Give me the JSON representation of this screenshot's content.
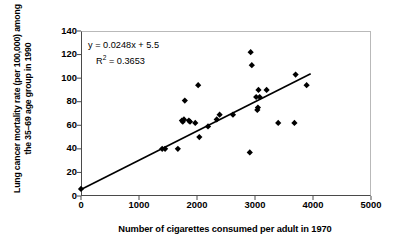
{
  "chart_data": {
    "type": "scatter",
    "title": "",
    "xlabel": "Number of cigarettes consumed per adult in 1970",
    "ylabel": "Lung cancer mortality rate (per 100,000) among the 35–69 age group in 1990",
    "xlim": [
      0,
      5000
    ],
    "ylim": [
      0,
      140
    ],
    "xticks": [
      0,
      1000,
      2000,
      3000,
      4000,
      5000
    ],
    "yticks": [
      0,
      20,
      40,
      60,
      80,
      100,
      120,
      140
    ],
    "xtick_labels": [
      "0",
      "1000",
      "2000",
      "3000",
      "4000",
      "5000"
    ],
    "ytick_labels": [
      "0",
      "20",
      "40",
      "60",
      "80",
      "100",
      "120",
      "140"
    ],
    "grid": false,
    "legend": null,
    "marker": "diamond",
    "marker_color": "#000000",
    "points": [
      {
        "x": 0,
        "y": 6
      },
      {
        "x": 1400,
        "y": 40
      },
      {
        "x": 1450,
        "y": 40
      },
      {
        "x": 1670,
        "y": 40
      },
      {
        "x": 1740,
        "y": 64
      },
      {
        "x": 1755,
        "y": 63
      },
      {
        "x": 1775,
        "y": 65
      },
      {
        "x": 1790,
        "y": 81
      },
      {
        "x": 1860,
        "y": 64
      },
      {
        "x": 1880,
        "y": 63
      },
      {
        "x": 1970,
        "y": 62
      },
      {
        "x": 2020,
        "y": 94
      },
      {
        "x": 2040,
        "y": 50
      },
      {
        "x": 2190,
        "y": 59
      },
      {
        "x": 2340,
        "y": 65
      },
      {
        "x": 2390,
        "y": 69
      },
      {
        "x": 2620,
        "y": 69
      },
      {
        "x": 2910,
        "y": 37
      },
      {
        "x": 2925,
        "y": 122
      },
      {
        "x": 2945,
        "y": 111
      },
      {
        "x": 3020,
        "y": 84
      },
      {
        "x": 3040,
        "y": 73
      },
      {
        "x": 3050,
        "y": 75
      },
      {
        "x": 3060,
        "y": 90
      },
      {
        "x": 3080,
        "y": 84
      },
      {
        "x": 3200,
        "y": 90
      },
      {
        "x": 3400,
        "y": 62
      },
      {
        "x": 3680,
        "y": 62
      },
      {
        "x": 3700,
        "y": 103
      },
      {
        "x": 3890,
        "y": 94
      }
    ],
    "trendline": {
      "type": "linear",
      "slope": 0.0248,
      "intercept": 5.5,
      "x_start": 0,
      "x_end": 3960,
      "color": "#000000"
    },
    "annotation": {
      "equation": "y = 0.0248x + 5.5",
      "r_squared_prefix": "R",
      "r_squared_exponent": "2",
      "r_squared_value": " = 0.3653"
    }
  }
}
